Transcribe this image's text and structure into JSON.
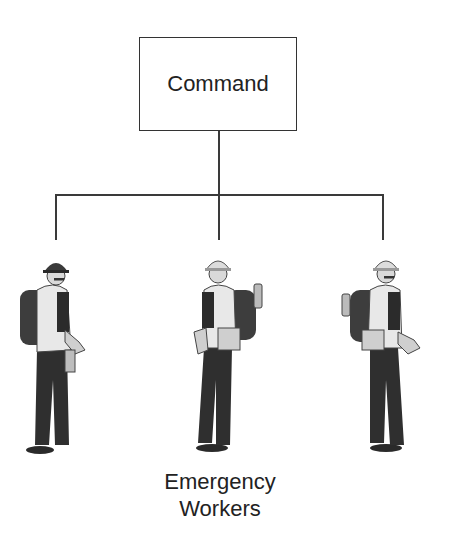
{
  "diagram": {
    "type": "org-hierarchy",
    "root": {
      "label": "Command"
    },
    "children": [
      {
        "id": "worker-1",
        "role": "emergency-worker",
        "helmet": "dark"
      },
      {
        "id": "worker-2",
        "role": "emergency-worker",
        "helmet": "light"
      },
      {
        "id": "worker-3",
        "role": "emergency-worker",
        "helmet": "light"
      }
    ],
    "children_caption_line1": "Emergency",
    "children_caption_line2": "Workers",
    "colors": {
      "line": "#3a3a3a",
      "background": "#ffffff",
      "text": "#222222"
    }
  }
}
